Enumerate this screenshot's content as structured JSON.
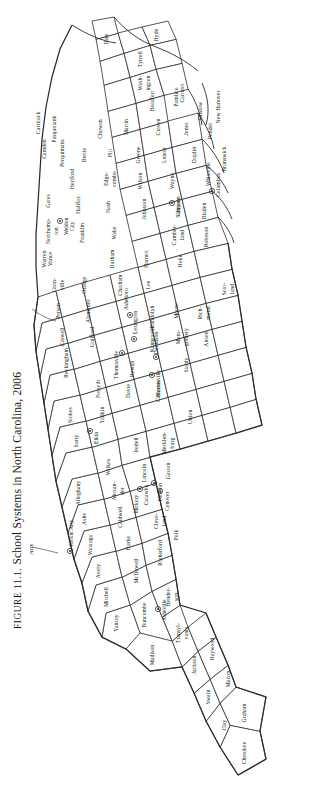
{
  "figure": {
    "label": "FIGURE 11.1.",
    "title": "School Systems in North Carolina, 2006",
    "caption_full": "FIGURE 11.1. School Systems in North Carolina, 2006",
    "year": "2006",
    "state": "North Carolina",
    "orientation": "caption and map rotated 90 degrees counter-clockwise",
    "colors": {
      "background": "#ffffff",
      "county_fill": "#ffffff",
      "county_stroke": "#3a3a3a",
      "coast_stroke": "#2d2d2d",
      "text": "#161616"
    }
  },
  "map": {
    "type": "choropleth-outline",
    "annotations": [
      {
        "name": "Roanoke Rapids",
        "kind": "leader-label"
      },
      {
        "name": "Mount Airy",
        "kind": "leader-label"
      }
    ],
    "counties": [
      {
        "name": "Cherokee"
      },
      {
        "name": "Clay"
      },
      {
        "name": "Graham"
      },
      {
        "name": "Swain"
      },
      {
        "name": "Macon"
      },
      {
        "name": "Jackson"
      },
      {
        "name": "Haywood"
      },
      {
        "name": "Transyl-\nvania"
      },
      {
        "name": "Madison"
      },
      {
        "name": "Buncombe"
      },
      {
        "name": "Hender-\nson"
      },
      {
        "name": "Yancey"
      },
      {
        "name": "Mitchell"
      },
      {
        "name": "McDowell"
      },
      {
        "name": "Rutherford"
      },
      {
        "name": "Polk"
      },
      {
        "name": "Avery"
      },
      {
        "name": "Burke"
      },
      {
        "name": "Cleve-\nland"
      },
      {
        "name": "Watauga"
      },
      {
        "name": "Caldwell"
      },
      {
        "name": "Catawba"
      },
      {
        "name": "Lincoln"
      },
      {
        "name": "Gaston"
      },
      {
        "name": "Alexan-\nder"
      },
      {
        "name": "Ashe"
      },
      {
        "name": "Alleghany"
      },
      {
        "name": "Wilkes"
      },
      {
        "name": "Iredell"
      },
      {
        "name": "Mecklen-\nburg"
      },
      {
        "name": "Union"
      },
      {
        "name": "Surry"
      },
      {
        "name": "Yadkin"
      },
      {
        "name": "Davie"
      },
      {
        "name": "Rowan"
      },
      {
        "name": "Cabarrus"
      },
      {
        "name": "Stanly"
      },
      {
        "name": "Anson"
      },
      {
        "name": "Stokes"
      },
      {
        "name": "Forsyth"
      },
      {
        "name": "Davidson"
      },
      {
        "name": "Mont-\ngomery"
      },
      {
        "name": "Rich-\nmond"
      },
      {
        "name": "Scot-\nland"
      },
      {
        "name": "Rockingham"
      },
      {
        "name": "Guilford"
      },
      {
        "name": "Randolph"
      },
      {
        "name": "Moore"
      },
      {
        "name": "Caswell"
      },
      {
        "name": "Alamance"
      },
      {
        "name": "Chatham"
      },
      {
        "name": "Lee"
      },
      {
        "name": "Hoke"
      },
      {
        "name": "Robeson"
      },
      {
        "name": "Person"
      },
      {
        "name": "Orange"
      },
      {
        "name": "Durham"
      },
      {
        "name": "Harnett"
      },
      {
        "name": "Cumber-\nland"
      },
      {
        "name": "Bladen"
      },
      {
        "name": "Columbus"
      },
      {
        "name": "Brunswick"
      },
      {
        "name": "Gran-\nville"
      },
      {
        "name": "Wake"
      },
      {
        "name": "Johnston"
      },
      {
        "name": "Sampson"
      },
      {
        "name": "Vance"
      },
      {
        "name": "Franklin"
      },
      {
        "name": "Warren"
      },
      {
        "name": "Nash"
      },
      {
        "name": "Wilson"
      },
      {
        "name": "Wayne"
      },
      {
        "name": "Duplin"
      },
      {
        "name": "Pender"
      },
      {
        "name": "New Hanover"
      },
      {
        "name": "Halifax"
      },
      {
        "name": "Edge-\ncombe"
      },
      {
        "name": "Greene"
      },
      {
        "name": "Lenoir"
      },
      {
        "name": "Jones"
      },
      {
        "name": "Onslow"
      },
      {
        "name": "Northamp-\nton"
      },
      {
        "name": "Pitt"
      },
      {
        "name": "Craven"
      },
      {
        "name": "Carteret"
      },
      {
        "name": "Hertford"
      },
      {
        "name": "Bertie"
      },
      {
        "name": "Martin"
      },
      {
        "name": "Beaufort"
      },
      {
        "name": "Pamlico"
      },
      {
        "name": "Gates"
      },
      {
        "name": "Chowan"
      },
      {
        "name": "Wash-\nington"
      },
      {
        "name": "Tyrrell"
      },
      {
        "name": "Hyde"
      },
      {
        "name": "Dare"
      },
      {
        "name": "Perquimans"
      },
      {
        "name": "Pasquotank"
      },
      {
        "name": "Camden"
      },
      {
        "name": "Currituck"
      }
    ],
    "city_systems": [
      {
        "name": "Mount Airy"
      },
      {
        "name": "Elkin"
      },
      {
        "name": "Thomasville"
      },
      {
        "name": "Lexington"
      },
      {
        "name": "Asheboro"
      },
      {
        "name": "Mooresville"
      },
      {
        "name": "Kannapolis"
      },
      {
        "name": "Hickory"
      },
      {
        "name": "Newton"
      },
      {
        "name": "Conover"
      },
      {
        "name": "Asheville"
      },
      {
        "name": "Weldon City"
      },
      {
        "name": "Clinton"
      },
      {
        "name": "Whiteville"
      }
    ]
  }
}
